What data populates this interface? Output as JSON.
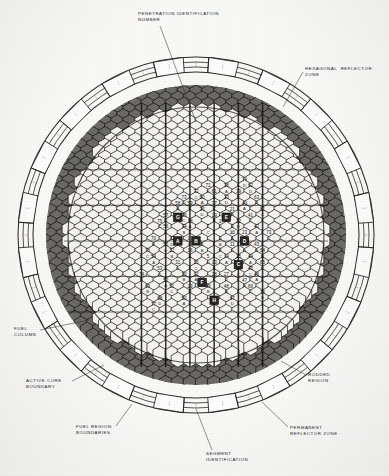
{
  "figure": {
    "background_color": "#fbfbfa",
    "ink_color": "#1d1b19"
  },
  "callouts": [
    {
      "id": "penetration-identification-number",
      "label": "PENETRATION IDENTIFICATION\nNUMBER",
      "x": 138,
      "y": 11,
      "leader": {
        "x1": 160,
        "y1": 26,
        "x2": 196,
        "y2": 122
      }
    },
    {
      "id": "hexagonal-reflector-zone",
      "label": "HEXAGONAL  REFLECTOR\nZONE",
      "x": 305,
      "y": 66,
      "leader": {
        "x1": 303,
        "y1": 72,
        "x2": 283,
        "y2": 107
      }
    },
    {
      "id": "fuel-column",
      "label": "FUEL\nCOLUMN",
      "x": 14,
      "y": 326,
      "leader": {
        "x1": 40,
        "y1": 330,
        "x2": 89,
        "y2": 320
      }
    },
    {
      "id": "active-core-boundary",
      "label": "ACTIVE CORE\nBOUNDARY",
      "x": 26,
      "y": 378,
      "leader": {
        "x1": 72,
        "y1": 381,
        "x2": 104,
        "y2": 365
      }
    },
    {
      "id": "fuel-region-boundaries",
      "label": "FUEL REGION\nBOUNDARIES",
      "x": 76,
      "y": 424,
      "leader": {
        "x1": 116,
        "y1": 426,
        "x2": 132,
        "y2": 404
      }
    },
    {
      "id": "segment-identification",
      "label": "SEGMENT\nIDENTIFICATION",
      "x": 206,
      "y": 451,
      "leader": {
        "x1": 212,
        "y1": 450,
        "x2": 196,
        "y2": 409
      }
    },
    {
      "id": "permanent-reflector-zone",
      "label": "PERMANENT\nREFLECTOR ZONE",
      "x": 290,
      "y": 425,
      "leader": {
        "x1": 288,
        "y1": 427,
        "x2": 262,
        "y2": 402
      }
    },
    {
      "id": "rodded-region",
      "label": "RODDED\nREGION",
      "x": 308,
      "y": 372,
      "leader": {
        "x1": 306,
        "y1": 375,
        "x2": 281,
        "y2": 361
      }
    }
  ],
  "geometry": {
    "center": {
      "x": 196,
      "y": 235
    },
    "outer_ring": {
      "radii": [
        178,
        173,
        168,
        163
      ],
      "segment_count": 40,
      "segment_block_count": 20
    },
    "hex": {
      "radius": 7.6,
      "columns": 23,
      "rows": 25
    }
  },
  "zones": {
    "permanent_reflector": {
      "name": "PERMANENT REFLECTOR ZONE",
      "color": "#f2f1ee"
    },
    "hexagonal_reflector": {
      "name": "HEXAGONAL REFLECTOR ZONE",
      "color": "#6d6b67"
    },
    "active_core": {
      "name": "ACTIVE CORE",
      "color": "#f6f5f2"
    },
    "rodded_region": {
      "name": "RODDED REGION",
      "color": "#2a2826"
    }
  },
  "fuel_columns": [
    {
      "n": "72",
      "s": "C",
      "q": 0,
      "r": -7
    },
    {
      "n": "71",
      "s": "D",
      "q": 2,
      "r": -8
    },
    {
      "n": "60",
      "s": "A",
      "q": 1,
      "r": -6
    },
    {
      "n": "61",
      "s": "B",
      "q": 3,
      "r": -7
    },
    {
      "n": "38",
      "s": "A",
      "q": 5,
      "r": -8
    },
    {
      "n": "73",
      "s": "D",
      "q": -2,
      "r": -6
    },
    {
      "n": "59",
      "s": "B",
      "q": -1,
      "r": -5
    },
    {
      "n": "58",
      "s": "A",
      "q": -3,
      "r": -5
    },
    {
      "n": "37",
      "s": "C",
      "q": 3,
      "r": -5
    },
    {
      "n": "20",
      "s": "D",
      "q": 5,
      "r": -6
    },
    {
      "n": "39",
      "s": "C",
      "q": 7,
      "r": -7
    },
    {
      "n": "62",
      "s": "D",
      "q": 9,
      "r": -8
    },
    {
      "n": "36",
      "s": "D",
      "q": 1,
      "r": -4
    },
    {
      "n": "35",
      "s": "C",
      "q": -2,
      "r": -3
    },
    {
      "n": "57",
      "s": "D",
      "q": -5,
      "r": -3
    },
    {
      "n": "74",
      "s": "D",
      "q": 8,
      "r": -9
    },
    {
      "n": "75",
      "s": "C",
      "q": -6,
      "r": -2
    },
    {
      "n": "21",
      "s": "B",
      "q": 6,
      "r": -4
    },
    {
      "n": "40",
      "s": "A",
      "q": 8,
      "r": -5
    },
    {
      "n": "63",
      "s": "B",
      "q": 10,
      "r": -6
    },
    {
      "n": "19",
      "s": "B",
      "q": 3,
      "r": -3
    },
    {
      "n": "34",
      "s": "B",
      "q": -2,
      "r": -1
    },
    {
      "n": "56",
      "s": "A",
      "q": -5,
      "r": -1
    },
    {
      "n": "22",
      "s": "D",
      "q": 7,
      "r": -2
    },
    {
      "n": "41",
      "s": "C",
      "q": 9,
      "r": -3
    },
    {
      "n": "81",
      "s": "C",
      "q": 11,
      "r": -4
    },
    {
      "n": "7",
      "s": "C",
      "q": 2,
      "r": -1
    },
    {
      "n": "2",
      "s": "D",
      "q": 4,
      "r": -2
    },
    {
      "n": "9",
      "s": "C",
      "q": 6,
      "r": -1
    },
    {
      "n": "17",
      "s": "D",
      "q": -1,
      "r": 1
    },
    {
      "n": "33",
      "s": "D",
      "q": -4,
      "r": 1
    },
    {
      "n": "70",
      "s": "B",
      "q": -7,
      "r": 1
    },
    {
      "n": "55",
      "s": "D",
      "q": -5,
      "r": 2
    },
    {
      "n": "23",
      "s": "B",
      "q": 8,
      "r": 0
    },
    {
      "n": "42",
      "s": "A",
      "q": 10,
      "r": -1
    },
    {
      "n": "78",
      "s": "C",
      "q": -8,
      "r": 3
    },
    {
      "n": "6",
      "s": "B",
      "q": 1,
      "r": 2
    },
    {
      "n": "3",
      "s": "B",
      "q": 4,
      "r": 1
    },
    {
      "n": "11",
      "s": "D",
      "q": 6,
      "r": 2
    },
    {
      "n": "24",
      "s": "B",
      "q": 8,
      "r": 2
    },
    {
      "n": "43",
      "s": "B",
      "q": 10,
      "r": 2
    },
    {
      "n": "73",
      "s": "C",
      "q": 12,
      "r": 0
    },
    {
      "n": "32",
      "s": "B",
      "q": -4,
      "r": 3
    },
    {
      "n": "54",
      "s": "A",
      "q": -7,
      "r": 4
    },
    {
      "n": "5",
      "s": "D",
      "q": 2,
      "r": 4
    },
    {
      "n": "4",
      "s": "C",
      "q": 4,
      "r": 3
    },
    {
      "n": "25",
      "s": "B",
      "q": 7,
      "r": 4
    },
    {
      "n": "44",
      "s": "A",
      "q": 9,
      "r": 4
    },
    {
      "n": "64",
      "s": "B",
      "q": 11,
      "r": 3
    },
    {
      "n": "15",
      "s": "C",
      "q": 0,
      "r": 5
    },
    {
      "n": "31",
      "s": "D",
      "q": -3,
      "r": 5
    },
    {
      "n": "53",
      "s": "C",
      "q": -6,
      "r": 6
    },
    {
      "n": "13",
      "s": "B",
      "q": 3,
      "r": 5
    },
    {
      "n": "26",
      "s": "C",
      "q": 7,
      "r": 6
    },
    {
      "n": "45",
      "s": "C",
      "q": 9,
      "r": 6
    },
    {
      "n": "65",
      "s": "C",
      "q": 11,
      "r": 5
    },
    {
      "n": "74",
      "s": "B",
      "q": -9,
      "r": 7
    },
    {
      "n": "30",
      "s": "B",
      "q": -2,
      "r": 7
    },
    {
      "n": "52",
      "s": "A",
      "q": -5,
      "r": 8
    },
    {
      "n": "28",
      "s": "C",
      "q": 3,
      "r": 7
    },
    {
      "n": "27",
      "s": "D",
      "q": 5,
      "r": 7
    },
    {
      "n": "47",
      "s": "B",
      "q": 8,
      "r": 8
    },
    {
      "n": "46",
      "s": "A",
      "q": 10,
      "r": 7
    },
    {
      "n": "69",
      "s": "B",
      "q": -8,
      "r": 9
    },
    {
      "n": "29",
      "s": "D",
      "q": -1,
      "r": 9
    },
    {
      "n": "51",
      "s": "C",
      "q": -4,
      "r": 9
    },
    {
      "n": "49",
      "s": "B",
      "q": 2,
      "r": 9
    },
    {
      "n": "48",
      "s": "A",
      "q": 5,
      "r": 9
    },
    {
      "n": "66",
      "s": "C",
      "q": 9,
      "r": 9
    },
    {
      "n": "68",
      "s": "D",
      "q": -6,
      "r": 11
    },
    {
      "n": "50",
      "s": "A",
      "q": -2,
      "r": 11
    },
    {
      "n": "67",
      "s": "D",
      "q": 6,
      "r": 11
    },
    {
      "n": "77",
      "s": "C",
      "q": -7,
      "r": 12
    },
    {
      "n": "76",
      "s": "D",
      "q": 11,
      "r": 10
    },
    {
      "n": "16",
      "s": "A",
      "q": -1,
      "r": 3
    },
    {
      "n": "18",
      "s": "A",
      "q": -1,
      "r": -2
    },
    {
      "n": "12",
      "s": "A",
      "q": 0,
      "r": 7
    },
    {
      "n": "14",
      "s": "A",
      "q": 5,
      "r": 4
    },
    {
      "n": "10",
      "s": "A",
      "q": 6,
      "r": 0
    }
  ],
  "penetrations": [
    {
      "id": "E",
      "q": 5,
      "r": -3
    },
    {
      "id": "B",
      "q": 0,
      "r": 1
    },
    {
      "id": "A",
      "q": -3,
      "r": 1
    },
    {
      "id": "D",
      "q": 8,
      "r": 1
    },
    {
      "id": "C",
      "q": 7,
      "r": 5
    },
    {
      "id": "F",
      "q": 1,
      "r": 8
    },
    {
      "id": "G",
      "q": -3,
      "r": -3
    },
    {
      "id": "H",
      "q": 3,
      "r": 11
    }
  ],
  "segment_labels": [
    "A",
    "B",
    "C",
    "D"
  ],
  "legend_note": ""
}
